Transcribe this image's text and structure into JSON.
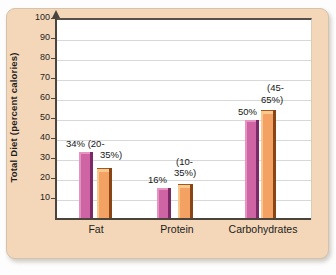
{
  "chart_data": {
    "type": "bar",
    "title": "",
    "ylabel": "Total Diet (percent calories)",
    "categories": [
      "Fat",
      "Protein",
      "Carbohydrates"
    ],
    "series": [
      {
        "name": "pink",
        "color": "#cf64a4",
        "values": [
          34,
          16,
          50
        ],
        "labels": [
          "34%",
          "16%",
          "50%"
        ]
      },
      {
        "name": "orange",
        "color": "#f4a263",
        "values": [
          26,
          18,
          55
        ],
        "labels": [
          "(20-35%)",
          "(10-35%)",
          "(45-65%)"
        ]
      }
    ],
    "annotations": [
      "34% (20-",
      "35%)",
      "(10-",
      "35%)",
      "16%",
      "(45-",
      "65%)",
      "50%"
    ],
    "ylim": [
      0,
      100
    ],
    "yticks": [
      10,
      20,
      30,
      40,
      50,
      60,
      70,
      80,
      90,
      100
    ],
    "grid": true,
    "legend": "none",
    "colors": {
      "card_background": "#f4d7b9",
      "pink_bar": "#cf64a4",
      "pink_bar_shadow": "#7c2a66",
      "orange_bar": "#f4a263",
      "orange_bar_shadow": "#8a4517",
      "gridline": "#d8d8d8",
      "axis": "#4a443c"
    }
  }
}
